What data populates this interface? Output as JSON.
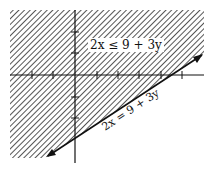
{
  "diagram": {
    "type": "inequality-graph",
    "inequality_label": "2x ≤ 9 + 3y",
    "boundary_label": "2x = 9 + 3y",
    "shaded_side": "above-left of boundary line",
    "axes": {
      "x_ticks": [
        -3,
        -2,
        -1,
        0,
        1,
        2,
        3,
        4,
        5
      ],
      "y_ticks": [
        -2,
        -1,
        0,
        1,
        2
      ],
      "x_intercept": 4.5,
      "y_intercept": -3
    },
    "colors": {
      "hatch": "#222222",
      "line": "#111111",
      "background": "#ffffff"
    }
  }
}
